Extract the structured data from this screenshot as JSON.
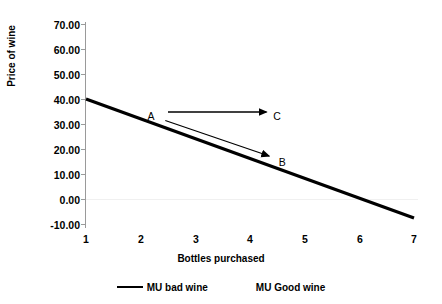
{
  "chart_data": {
    "type": "line",
    "title": "",
    "xlabel": "Bottles purchased",
    "ylabel": "Price of wine",
    "xlim": [
      1,
      7
    ],
    "ylim": [
      -10,
      70
    ],
    "xticks": [
      "1",
      "2",
      "3",
      "4",
      "5",
      "6",
      "7"
    ],
    "yticks": [
      "70.00",
      "60.00",
      "50.00",
      "40.00",
      "30.00",
      "20.00",
      "10.00",
      "0.00",
      "-10.00"
    ],
    "ytick_values": [
      70,
      60,
      50,
      40,
      30,
      20,
      10,
      0,
      -10
    ],
    "grid": false,
    "legend_position": "bottom",
    "series": [
      {
        "name": "MU bad wine",
        "x": [
          1,
          7
        ],
        "values": [
          40.0,
          -7.6
        ],
        "color": "#000000",
        "has_line_marker": true
      },
      {
        "name": "MU Good wine",
        "x": [],
        "values": [],
        "color": "#000000",
        "has_line_marker": false
      }
    ],
    "annotations": [
      {
        "label": "A",
        "x": 2.2,
        "y": 33.0
      },
      {
        "label": "C",
        "x": 4.5,
        "y": 33.0
      },
      {
        "label": "B",
        "x": 4.6,
        "y": 14.5
      }
    ],
    "arrows": [
      {
        "name": "a-to-c",
        "from_label": "A",
        "to_label": "C",
        "x1": 2.5,
        "y1": 34.8,
        "x2": 4.3,
        "y2": 34.8
      },
      {
        "name": "a-to-b",
        "from_label": "A",
        "to_label": "B",
        "x1": 2.45,
        "y1": 31.4,
        "x2": 4.35,
        "y2": 17.2
      }
    ]
  }
}
